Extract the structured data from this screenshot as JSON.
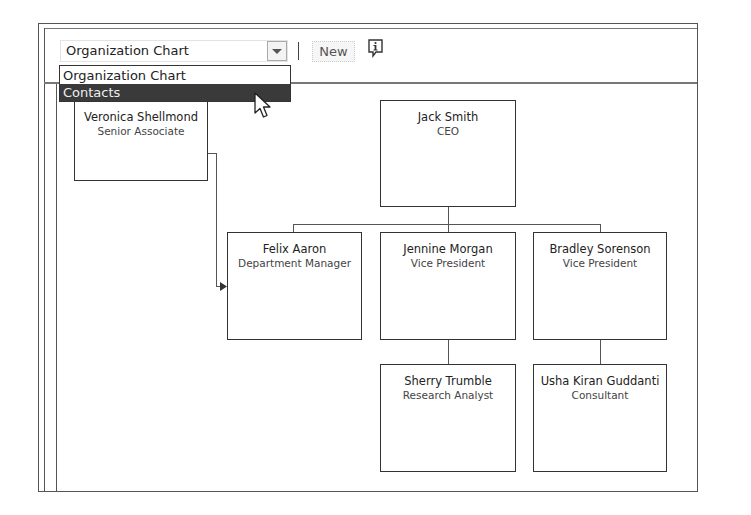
{
  "toolbar": {
    "view_select": {
      "value": "Organization Chart",
      "icon": "chevron-down-icon"
    },
    "new_label": "New",
    "info_icon": "info-icon"
  },
  "dropdown": {
    "items": [
      {
        "label": "Organization Chart",
        "selected": false
      },
      {
        "label": "Contacts",
        "selected": true
      }
    ]
  },
  "org_chart": {
    "unassigned": [
      {
        "name": "Veronica Shellmond",
        "title": "Senior Associate"
      }
    ],
    "root": {
      "name": "Jack Smith",
      "title": "CEO"
    },
    "level2": [
      {
        "name": "Felix Aaron",
        "title": "Department Manager"
      },
      {
        "name": "Jennine Morgan",
        "title": "Vice President"
      },
      {
        "name": "Bradley Sorenson",
        "title": "Vice President"
      }
    ],
    "level3": [
      {
        "name": "Sherry Trumble",
        "title": "Research Analyst",
        "manager": "Jennine Morgan"
      },
      {
        "name": "Usha Kiran Guddanti",
        "title": "Consultant",
        "manager": "Bradley Sorenson"
      }
    ]
  },
  "colors": {
    "border": "#333333",
    "selected_bg": "#3a3a3a",
    "selected_text": "#eeeeee"
  }
}
